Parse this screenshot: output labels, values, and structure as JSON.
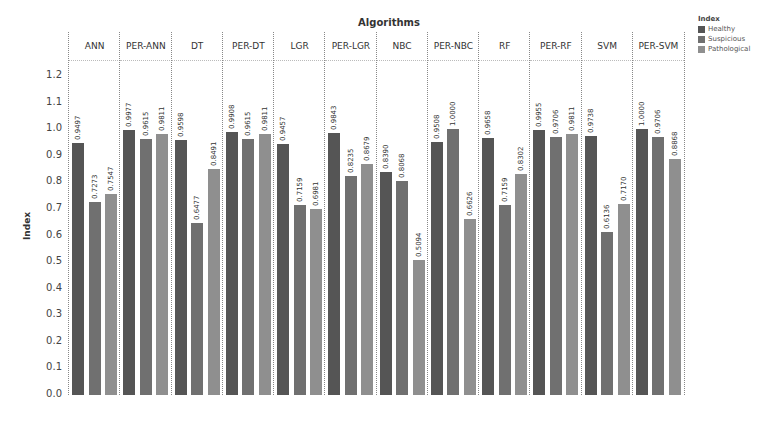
{
  "chart_data": {
    "type": "bar",
    "title": "Algorithms",
    "xlabel": "Algorithms",
    "ylabel": "Index",
    "ylim": [
      0,
      1.2
    ],
    "yticks": [
      "0.0",
      "0.1",
      "0.2",
      "0.3",
      "0.4",
      "0.5",
      "0.6",
      "0.7",
      "0.8",
      "0.9",
      "1.0",
      "1.1",
      "1.2"
    ],
    "grid": false,
    "legend_position": "top-right",
    "legend_title": "Index",
    "categories": [
      "ANN",
      "PER-ANN",
      "DT",
      "PER-DT",
      "LGR",
      "PER-LGR",
      "NBC",
      "PER-NBC",
      "RF",
      "PER-RF",
      "SVM",
      "PER-SVM"
    ],
    "series": [
      {
        "name": "Healthy",
        "color": "#555555",
        "values": [
          0.9497,
          0.9977,
          0.9598,
          0.9908,
          0.9457,
          0.9843,
          0.839,
          0.9508,
          0.9658,
          0.9955,
          0.9738,
          1.0
        ]
      },
      {
        "name": "Suspicious",
        "color": "#707070",
        "values": [
          0.7273,
          0.9615,
          0.6477,
          0.9615,
          0.7159,
          0.8235,
          0.8068,
          1.0,
          0.7159,
          0.9706,
          0.6136,
          0.9706
        ]
      },
      {
        "name": "Pathological",
        "color": "#8f8f8f",
        "values": [
          0.7547,
          0.9811,
          0.8491,
          0.9811,
          0.6981,
          0.8679,
          0.5094,
          0.6626,
          0.8302,
          0.9811,
          0.717,
          0.8868
        ]
      }
    ],
    "value_labels": [
      [
        "0.9497",
        "0.7273",
        "0.7547"
      ],
      [
        "0.9977",
        "0.9615",
        "0.9811"
      ],
      [
        "0.9598",
        "0.6477",
        "0.8491"
      ],
      [
        "0.9908",
        "0.9615",
        "0.9811"
      ],
      [
        "0.9457",
        "0.7159",
        "0.6981"
      ],
      [
        "0.9843",
        "0.8235",
        "0.8679"
      ],
      [
        "0.8390",
        "0.8068",
        "0.5094"
      ],
      [
        "0.9508",
        "1.0000",
        "0.6626"
      ],
      [
        "0.9658",
        "0.7159",
        "0.8302"
      ],
      [
        "0.9955",
        "0.9706",
        "0.9811"
      ],
      [
        "0.9738",
        "0.6136",
        "0.7170"
      ],
      [
        "1.0000",
        "0.9706",
        "0.8868"
      ]
    ]
  },
  "legend": {
    "title": "Index",
    "items": [
      {
        "label": "Healthy",
        "color": "#555555"
      },
      {
        "label": "Suspicious",
        "color": "#707070"
      },
      {
        "label": "Pathological",
        "color": "#8f8f8f"
      }
    ]
  }
}
